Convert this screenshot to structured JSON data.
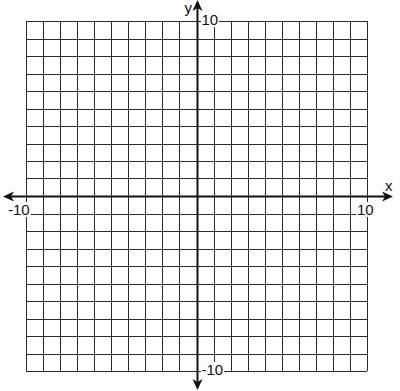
{
  "chart_data": {
    "type": "line",
    "title": "",
    "xlabel": "x",
    "ylabel": "y",
    "xlim": [
      -10,
      10
    ],
    "ylim": [
      -10,
      10
    ],
    "grid": true,
    "grid_step": 1,
    "tick_labels": {
      "x_min": "-10",
      "x_max": "10",
      "y_min": "-10",
      "y_max": "10"
    },
    "series": [],
    "legend": null
  },
  "layout": {
    "grid_left": 26,
    "grid_top": 21,
    "grid_right": 367,
    "grid_bottom": 371,
    "axis_color": "#111111",
    "grid_color": "#2a2a2a"
  }
}
